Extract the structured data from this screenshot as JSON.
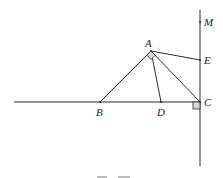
{
  "figure": {
    "type": "geometry",
    "caption_visible": "partially cut off",
    "points": {
      "A": {
        "label": "A",
        "x": 151,
        "y": 51
      },
      "B": {
        "label": "B",
        "x": 100,
        "y": 102
      },
      "C": {
        "label": "C",
        "x": 200,
        "y": 102
      },
      "D": {
        "label": "D",
        "x": 161,
        "y": 102
      },
      "E": {
        "label": "E",
        "x": 200,
        "y": 60
      },
      "M": {
        "label": "M",
        "x": 200,
        "y": 22
      }
    },
    "segments": [
      "AB",
      "AC",
      "AD",
      "AE"
    ],
    "lines": [
      "horizontal line through B, D, C",
      "vertical line through M, E, C"
    ],
    "right_angles": [
      "BAC at A",
      "at C between line BC and line CM"
    ]
  }
}
